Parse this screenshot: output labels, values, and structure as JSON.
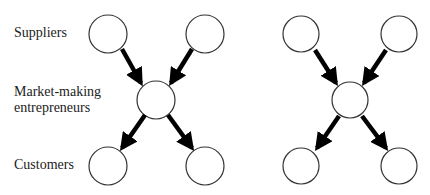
{
  "labels": {
    "suppliers": "Suppliers",
    "market_line1": "Market-making",
    "market_line2": "entrepreneurs",
    "customers": "Customers"
  },
  "diagrams": [
    {
      "name": "left",
      "nodes": [
        {
          "id": "s1",
          "cx": 108,
          "cy": 34
        },
        {
          "id": "s2",
          "cx": 205,
          "cy": 34
        },
        {
          "id": "m",
          "cx": 156,
          "cy": 100
        },
        {
          "id": "c1",
          "cx": 108,
          "cy": 166
        },
        {
          "id": "c2",
          "cx": 205,
          "cy": 166
        }
      ]
    },
    {
      "name": "right",
      "nodes": [
        {
          "id": "s1",
          "cx": 301,
          "cy": 34
        },
        {
          "id": "s2",
          "cx": 399,
          "cy": 34
        },
        {
          "id": "m",
          "cx": 350,
          "cy": 100
        },
        {
          "id": "c1",
          "cx": 301,
          "cy": 166
        },
        {
          "id": "c2",
          "cx": 399,
          "cy": 166
        }
      ]
    }
  ],
  "colors": {
    "stroke": "#333333",
    "arrow": "#000000"
  }
}
